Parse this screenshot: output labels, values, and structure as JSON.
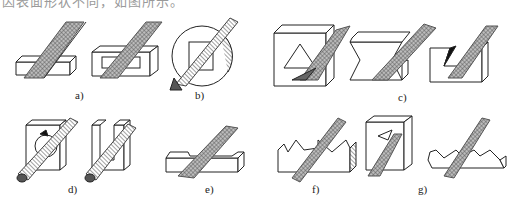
{
  "caption": "因表面形状不同，如图所示。",
  "figure": {
    "subfigures": [
      {
        "label": "a)",
        "content": "flat file on flat surfaces and rectangular slot"
      },
      {
        "label": "b)",
        "content": "flat file on circular part with square hole"
      },
      {
        "label": "c)",
        "content": "triangular file on triangular hole, dovetail and angled slots"
      },
      {
        "label": "d)",
        "content": "round file on round hole and U-slot"
      },
      {
        "label": "e)",
        "content": "flat file on step surface"
      },
      {
        "label": "f)",
        "content": "square/triangular file on serrated profile"
      },
      {
        "label": "g)",
        "content": "files on square hole and serrated edge"
      }
    ]
  },
  "colors": {
    "line": "#222222",
    "hatch": "#666666",
    "bg": "#ffffff"
  }
}
